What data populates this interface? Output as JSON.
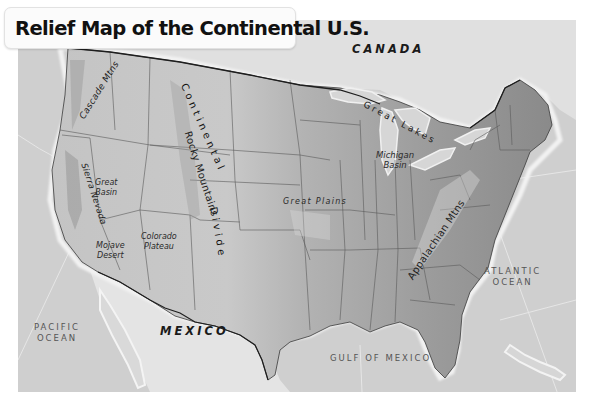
{
  "title": "Relief Map of the Continental U.S.",
  "colors": {
    "ocean": "#cfcfcf",
    "land_foreign": "#dedede",
    "us_west": "#bdbdbd",
    "us_plains": "#a9a9a9",
    "us_east": "#8f8f8f",
    "borders": "#2b2b2b",
    "coast_glow": "#f2f2f2"
  },
  "labels": {
    "countries": {
      "canada": "CANADA",
      "mexico": "MEXICO"
    },
    "oceans": {
      "pacific_line1": "PACIFIC",
      "pacific_line2": "OCEAN",
      "atlantic_line1": "ATLANTIC",
      "atlantic_line2": "OCEAN",
      "gulf": "GULF OF MEXICO"
    },
    "features": {
      "great_lakes": "Great Lakes",
      "cascade_mtns": "Cascade Mtns",
      "continental_divide": "Continental Divide",
      "continental_part": "Continental",
      "divide_part": "Divide",
      "rocky_mountains": "Rocky Mountains",
      "sierra_nevada": "Sierra Nevada",
      "great_basin_line1": "Great",
      "great_basin_line2": "Basin",
      "colorado_plateau_line1": "Colorado",
      "colorado_plateau_line2": "Plateau",
      "mojave_desert_line1": "Mojave",
      "mojave_desert_line2": "Desert",
      "great_plains": "Great Plains",
      "michigan_basin_line1": "Michigan",
      "michigan_basin_line2": "Basin",
      "appalachian_mtns": "Appalachian Mtns"
    }
  }
}
